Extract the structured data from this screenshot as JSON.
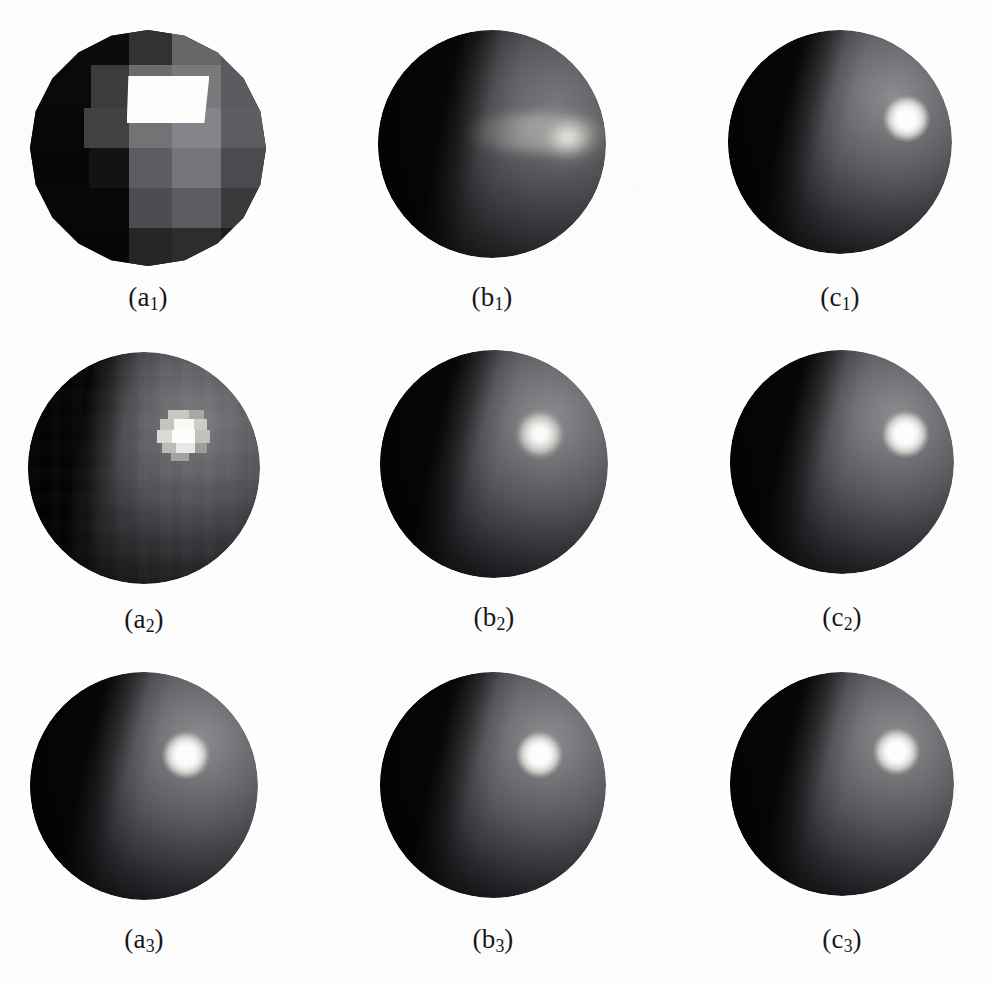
{
  "figure": {
    "kind": "image-grid",
    "background_color": "#fdfdfd",
    "rows": 3,
    "columns": 3,
    "width": 990,
    "height": 985
  },
  "panels": [
    {
      "id": "a1",
      "label": "(a",
      "sub": "1",
      "label_close": ")",
      "caption": "(a1)",
      "row": 1,
      "column": 1,
      "shading": "flat-faceted",
      "highlight": "blocky-white-facet",
      "sphere_color": "#6f6f73",
      "highlight_color": "#ffffff"
    },
    {
      "id": "b1",
      "label": "(b",
      "sub": "1",
      "label_close": ")",
      "caption": "(b1)",
      "row": 1,
      "column": 2,
      "shading": "gouraud",
      "highlight": "broad-smeared",
      "sphere_color": "#5a5a5e",
      "highlight_color": "#ededea"
    },
    {
      "id": "c1",
      "label": "(c",
      "sub": "1",
      "label_close": ")",
      "caption": "(c1)",
      "row": 1,
      "column": 3,
      "shading": "phong",
      "highlight": "tight-round",
      "sphere_color": "#55555a",
      "highlight_color": "#ffffff"
    },
    {
      "id": "a2",
      "label": "(a",
      "sub": "2",
      "label_close": ")",
      "caption": "(a2)",
      "row": 2,
      "column": 1,
      "shading": "flat-coarse",
      "highlight": "blocky-pixelated",
      "sphere_color": "#5f5f63",
      "highlight_color": "#fbfbf8"
    },
    {
      "id": "b2",
      "label": "(b",
      "sub": "2",
      "label_close": ")",
      "caption": "(b2)",
      "row": 2,
      "column": 2,
      "shading": "gouraud-refined",
      "highlight": "soft-round",
      "sphere_color": "#56565b",
      "highlight_color": "#ffffff"
    },
    {
      "id": "c2",
      "label": "(c",
      "sub": "2",
      "label_close": ")",
      "caption": "(c2)",
      "row": 2,
      "column": 3,
      "shading": "phong",
      "highlight": "tight-round",
      "sphere_color": "#55555a",
      "highlight_color": "#ffffff"
    },
    {
      "id": "a3",
      "label": "(a",
      "sub": "3",
      "label_close": ")",
      "caption": "(a3)",
      "row": 3,
      "column": 1,
      "shading": "smooth",
      "highlight": "tight-round",
      "sphere_color": "#55555a",
      "highlight_color": "#ffffff"
    },
    {
      "id": "b3",
      "label": "(b",
      "sub": "3",
      "label_close": ")",
      "caption": "(b3)",
      "row": 3,
      "column": 2,
      "shading": "smooth",
      "highlight": "tight-round",
      "sphere_color": "#55555a",
      "highlight_color": "#ffffff"
    },
    {
      "id": "c3",
      "label": "(c",
      "sub": "3",
      "label_close": ")",
      "caption": "(c3)",
      "row": 3,
      "column": 3,
      "shading": "smooth",
      "highlight": "tight-round",
      "sphere_color": "#55555a",
      "highlight_color": "#ffffff"
    }
  ]
}
